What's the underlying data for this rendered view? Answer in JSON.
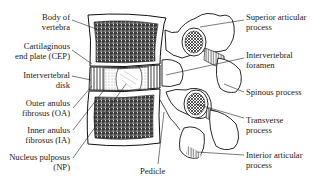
{
  "figure": {
    "ink_color": "#1a1a1a",
    "background": "#ffffff"
  },
  "labels_left": [
    {
      "id": "body-of-vertebra",
      "lines": [
        "Body of",
        "vertebra"
      ]
    },
    {
      "id": "cartilaginous-end-plate",
      "lines": [
        "Cartilaginous",
        "end plate (CEP)"
      ]
    },
    {
      "id": "intervertebral-disk",
      "lines": [
        "Intervertebral",
        "disk"
      ]
    },
    {
      "id": "outer-anulus-fibrosus",
      "lines": [
        "Outer anulus",
        "fibrosus (OA)"
      ]
    },
    {
      "id": "inner-anulus-fibrosus",
      "lines": [
        "Inner anulus",
        "fibrosus (IA)"
      ]
    },
    {
      "id": "nucleus-pulposus",
      "lines": [
        "Nucleus pulposus",
        "(NP)"
      ]
    }
  ],
  "labels_right": [
    {
      "id": "superior-articular-process",
      "lines": [
        "Superior articular",
        "process"
      ]
    },
    {
      "id": "intervertebral-foramen",
      "lines": [
        "Intervertebral",
        "foramen"
      ]
    },
    {
      "id": "spinous-process",
      "lines": [
        "Spinous process"
      ]
    },
    {
      "id": "transverse-process",
      "lines": [
        "Transverse",
        "process"
      ]
    },
    {
      "id": "interior-articular-process",
      "lines": [
        "Interior articular",
        "process"
      ]
    }
  ],
  "labels_bottom": [
    {
      "id": "pedicle",
      "lines": [
        "Pedicle"
      ]
    }
  ]
}
